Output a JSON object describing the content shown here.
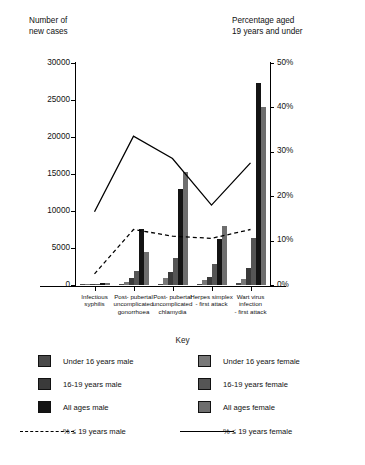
{
  "chart_data": {
    "type": "bar",
    "title": "",
    "left_axis": {
      "label": "Number of\nnew cases",
      "ticks": [
        0,
        5000,
        10000,
        15000,
        20000,
        25000,
        30000
      ],
      "ticklabels": [
        "0",
        "5000",
        "10000",
        "15000",
        "20000",
        "25000",
        "30000"
      ],
      "ylim": [
        0,
        30000
      ]
    },
    "right_axis": {
      "label": "Percentage aged\n19 years and under",
      "ticks": [
        0,
        10,
        20,
        30,
        40,
        50
      ],
      "ticklabels": [
        "0%",
        "10%",
        "20%",
        "30%",
        "40%",
        "50%"
      ],
      "ylim": [
        0,
        50
      ]
    },
    "grid": false,
    "legend_position": "bottom",
    "xlabel": "",
    "categories": [
      "Infectious\nsyphilis",
      "Post- pubertal\nuncomplicated\ngonorrhoea",
      "Post- pubertal\nuncomplicated\nchlamydia",
      "Herpes simplex\n- first attack",
      "Wart virus\ninfection\n- first attack"
    ],
    "series": [
      {
        "name": "Under 16 years male",
        "color": "#4a4a4a",
        "axis": "left",
        "values": [
          30,
          120,
          190,
          150,
          260
        ]
      },
      {
        "name": "Under 16 years female",
        "color": "#787878",
        "axis": "left",
        "values": [
          40,
          430,
          950,
          700,
          820
        ]
      },
      {
        "name": "16-19 years male",
        "color": "#3a3a3a",
        "axis": "left",
        "values": [
          60,
          900,
          1700,
          1150,
          2250
        ]
      },
      {
        "name": "16-19 years female",
        "color": "#555555",
        "axis": "left",
        "values": [
          90,
          1850,
          3650,
          2850,
          6400
        ]
      },
      {
        "name": "All ages male",
        "color": "#141414",
        "axis": "left",
        "values": [
          330,
          7600,
          13000,
          6200,
          27300
        ]
      },
      {
        "name": "All ages female",
        "color": "#6e6e6e",
        "axis": "left",
        "values": [
          210,
          4400,
          15300,
          8000,
          24000
        ]
      }
    ],
    "lines": [
      {
        "name": "% ≤ 19 years male",
        "style": "dashed",
        "color": "#000000",
        "axis": "right",
        "values": [
          2.5,
          12.5,
          11.0,
          10.5,
          12.5
        ]
      },
      {
        "name": "% ≤ 19 years female",
        "style": "solid",
        "color": "#000000",
        "axis": "right",
        "values": [
          16.5,
          33.5,
          28.5,
          18.0,
          27.5
        ]
      }
    ]
  },
  "key": {
    "title": "Key",
    "entries": [
      {
        "label": "Under 16 years male",
        "type": "swatch",
        "color": "#4a4a4a",
        "column": "left",
        "row": 0
      },
      {
        "label": "16-19 years male",
        "type": "swatch",
        "color": "#3a3a3a",
        "column": "left",
        "row": 1
      },
      {
        "label": "All ages male",
        "type": "swatch",
        "color": "#141414",
        "column": "left",
        "row": 2
      },
      {
        "label": "Under 16 years female",
        "type": "swatch",
        "color": "#787878",
        "column": "right",
        "row": 0
      },
      {
        "label": "16-19 years female",
        "type": "swatch",
        "color": "#555555",
        "column": "right",
        "row": 1
      },
      {
        "label": "All ages female",
        "type": "swatch",
        "color": "#6e6e6e",
        "column": "right",
        "row": 2
      },
      {
        "label": "% ≤ 19 years male",
        "type": "line",
        "style": "dashed",
        "color": "#000000",
        "column": "left",
        "row": 3
      },
      {
        "label": "% ≤ 19 years  female",
        "type": "line",
        "style": "solid",
        "color": "#000000",
        "column": "right",
        "row": 3
      }
    ]
  }
}
